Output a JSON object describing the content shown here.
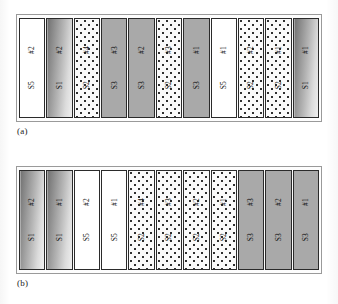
{
  "figure": {
    "caption_a": "(a)",
    "caption_b": "(b)"
  },
  "colors": {
    "bar_outline": "#2b2b2b",
    "frame_outline": "#9a9a9a",
    "fill_gray": "#a9a9a9",
    "fill_white": "#ffffff",
    "gradient_dark": "#6f6f6f",
    "gradient_light": "#efefef",
    "dot_color": "#2f2f2f",
    "text": "#111111"
  },
  "legend_fills": {
    "S1": "gradient",
    "S2": "dotted",
    "S3": "gray",
    "S5": "white"
  },
  "chart_data": {
    "type": "bar",
    "title": "",
    "xlabel": "",
    "ylabel": "",
    "panels": [
      {
        "caption": "(a)",
        "bars": [
          {
            "job": "#2",
            "stage": "S5",
            "fill": "white"
          },
          {
            "job": "#2",
            "stage": "S1",
            "fill": "gradient"
          },
          {
            "job": "#4",
            "stage": "S2",
            "fill": "dotted"
          },
          {
            "job": "#3",
            "stage": "S3",
            "fill": "gray"
          },
          {
            "job": "#2",
            "stage": "S3",
            "fill": "gray"
          },
          {
            "job": "#3",
            "stage": "S2",
            "fill": "dotted"
          },
          {
            "job": "#1",
            "stage": "S3",
            "fill": "gray"
          },
          {
            "job": "#1",
            "stage": "S5",
            "fill": "white"
          },
          {
            "job": "#2",
            "stage": "S2",
            "fill": "dotted"
          },
          {
            "job": "#1",
            "stage": "S2",
            "fill": "dotted"
          },
          {
            "job": "#1",
            "stage": "S1",
            "fill": "gradient"
          }
        ]
      },
      {
        "caption": "(b)",
        "bars": [
          {
            "job": "#2",
            "stage": "S1",
            "fill": "gradient"
          },
          {
            "job": "#1",
            "stage": "S1",
            "fill": "gradient"
          },
          {
            "job": "#2",
            "stage": "S5",
            "fill": "white"
          },
          {
            "job": "#1",
            "stage": "S5",
            "fill": "white"
          },
          {
            "job": "#4",
            "stage": "S2",
            "fill": "dotted"
          },
          {
            "job": "#3",
            "stage": "S2",
            "fill": "dotted"
          },
          {
            "job": "#2",
            "stage": "S2",
            "fill": "dotted"
          },
          {
            "job": "#1",
            "stage": "S2",
            "fill": "dotted"
          },
          {
            "job": "#3",
            "stage": "S3",
            "fill": "gray"
          },
          {
            "job": "#2",
            "stage": "S3",
            "fill": "gray"
          },
          {
            "job": "#1",
            "stage": "S3",
            "fill": "gray"
          }
        ]
      }
    ]
  }
}
